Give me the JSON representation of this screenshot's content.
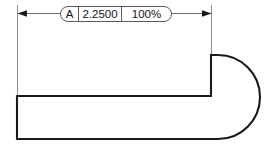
{
  "drawing": {
    "title": "Dimensioned part profile with scale callout",
    "background_color": "#ffffff",
    "outline_color": "#1a1a1a",
    "dimension_color": "#6e6e6e",
    "extension_color": "#8c8c8c",
    "text_color": "#141414"
  },
  "callout": {
    "datum_label": "A",
    "dimension_value": "2.2500",
    "scale_value": "100%",
    "frame_shape": "stadium-pill"
  },
  "dimension": {
    "left_arrow": "arrow-left",
    "right_arrow": "arrow-right",
    "span_start_x": 17,
    "span_end_x": 211,
    "line_y": 13
  },
  "geometry": {
    "type": "d-shape-with-notch",
    "body_top_y": 96,
    "body_bottom_y": 139,
    "body_left_x": 17,
    "notch_vertical_x": 211,
    "notch_top_y": 55,
    "arc_radius": 42,
    "arc_right_x": 255
  }
}
